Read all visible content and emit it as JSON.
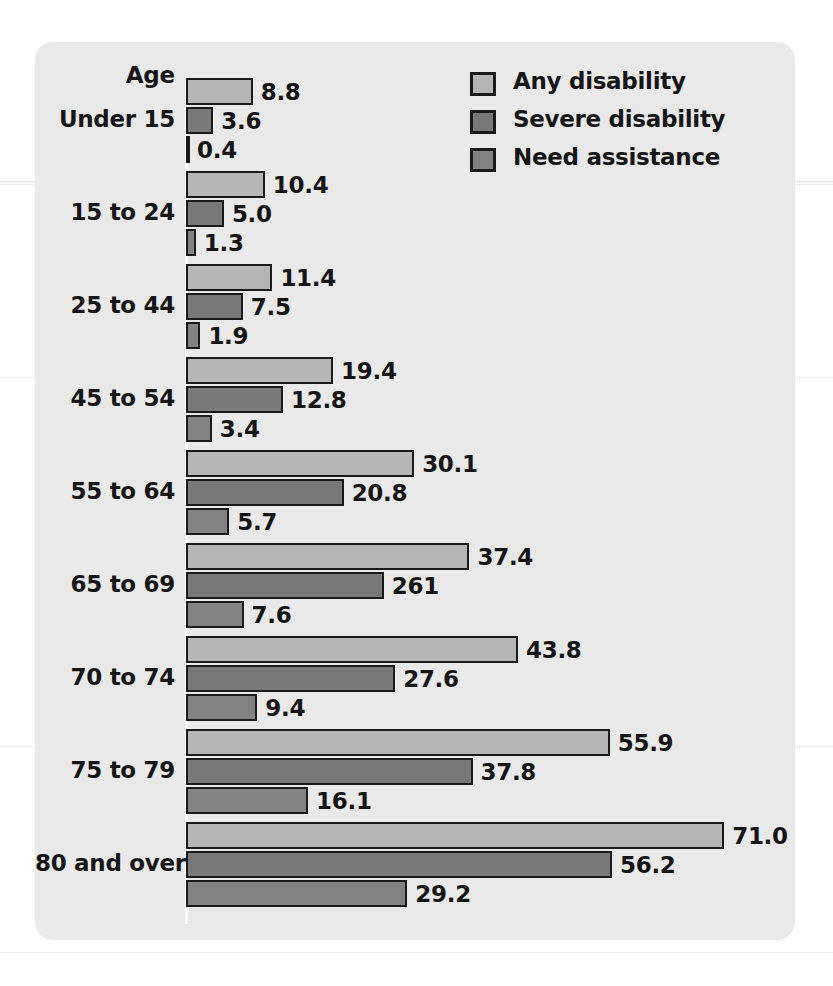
{
  "chart_data": {
    "type": "bar",
    "orientation": "horizontal",
    "title": "",
    "axis_title": "Age",
    "xlabel": "",
    "ylabel": "Age",
    "grid": false,
    "legend_position": "top-right",
    "xlim": [
      0,
      75
    ],
    "categories": [
      "Under 15",
      "15 to 24",
      "25 to 44",
      "45 to 54",
      "55 to 64",
      "65 to 69",
      "70 to 74",
      "75 to 79",
      "80 and over"
    ],
    "series": [
      {
        "name": "Any disability",
        "color": "#b5b5b5",
        "values": [
          8.8,
          10.4,
          11.4,
          19.4,
          30.1,
          37.4,
          43.8,
          55.9,
          71.0
        ],
        "labels": [
          "8.8",
          "10.4",
          "11.4",
          "19.4",
          "30.1",
          "37.4",
          "43.8",
          "55.9",
          "71.0"
        ]
      },
      {
        "name": "Severe disability",
        "color": "#787878",
        "values": [
          3.6,
          5.0,
          7.5,
          12.8,
          20.8,
          26.1,
          27.6,
          37.8,
          56.2
        ],
        "labels": [
          "3.6",
          "5.0",
          "7.5",
          "12.8",
          "20.8",
          "261",
          "27.6",
          "37.8",
          "56.2"
        ]
      },
      {
        "name": "Need assistance",
        "color": "#828282",
        "values": [
          0.4,
          1.3,
          1.9,
          3.4,
          5.7,
          7.6,
          9.4,
          16.1,
          29.2
        ],
        "labels": [
          "0.4",
          "1.3",
          "1.9",
          "3.4",
          "5.7",
          "7.6",
          "9.4",
          "16.1",
          "29.2"
        ]
      }
    ]
  },
  "legend": {
    "items": [
      {
        "label": "Any disability",
        "color": "#b5b5b5"
      },
      {
        "label": "Severe disability",
        "color": "#787878"
      },
      {
        "label": "Need assistance",
        "color": "#828282"
      }
    ]
  },
  "style": {
    "card_background": "#e9e9e9",
    "page_background": "#ffffff",
    "bar_outline": "#1a1a1a",
    "text_color": "#151515",
    "axis_color": "#ffffff"
  }
}
